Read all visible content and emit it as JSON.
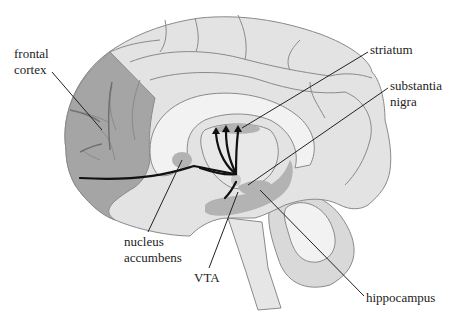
{
  "diagram": {
    "type": "anatomical-illustration",
    "colors": {
      "background": "#ffffff",
      "brain_fill": "#e3e3e3",
      "outline": "#8a8a8a",
      "frontal_cortex_fill": "#a5a5a5",
      "inner_white": "#f2f2f2",
      "structure_fill": "#b3b3b3",
      "pathway": "#111111",
      "leader_line": "#222222"
    },
    "labels": {
      "frontal_cortex": [
        "frontal",
        "cortex"
      ],
      "striatum": [
        "striatum"
      ],
      "substantia_nigra": [
        "substantia",
        "nigra"
      ],
      "nucleus_accumbens": [
        "nucleus",
        "accumbens"
      ],
      "vta": [
        "VTA"
      ],
      "hippocampus": [
        "hippocampus"
      ]
    }
  }
}
